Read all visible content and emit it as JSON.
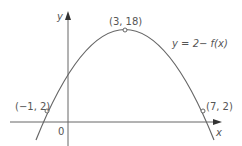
{
  "figure": {
    "axes": {
      "x_label": "x",
      "y_label": "y",
      "origin_label": "0"
    },
    "curve_label": "y = 2− f(x)",
    "points": [
      {
        "label": "(−1, 2)"
      },
      {
        "label": "(3, 18)"
      },
      {
        "label": "(7, 2)"
      }
    ],
    "colors": {
      "curve": "#666666",
      "axis": "#666666",
      "text": "#555555"
    }
  }
}
